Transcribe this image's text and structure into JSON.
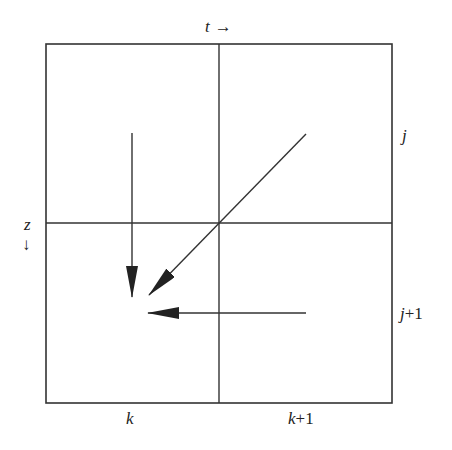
{
  "diagram": {
    "axis_labels": {
      "time": "t",
      "time_arrow": "→",
      "depth": "z",
      "depth_arrow": "↓"
    },
    "row_labels": [
      {
        "var": "j",
        "suffix": ""
      },
      {
        "var": "j",
        "suffix": "+1"
      }
    ],
    "column_labels": [
      {
        "var": "k",
        "suffix": ""
      },
      {
        "var": "k",
        "suffix": "+1"
      }
    ],
    "colors": {
      "line": "#333333",
      "background": "#ffffff"
    }
  }
}
